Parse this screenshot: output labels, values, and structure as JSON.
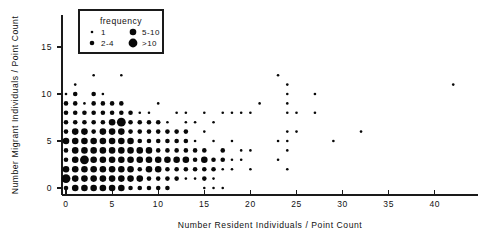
{
  "chart_data": {
    "type": "scatter",
    "title": "",
    "xlabel": "Number Resident Individuals / Point Count",
    "ylabel": "Number Migrant Individuals / Point Count",
    "xlim": [
      -1,
      44
    ],
    "ylim": [
      -1.2,
      17.5
    ],
    "xticks": [
      0,
      5,
      10,
      15,
      20,
      25,
      30,
      35,
      40
    ],
    "yticks": [
      0,
      5,
      10,
      15
    ],
    "xtick_labels": [
      "0",
      "5",
      "10",
      "15",
      "20",
      "25",
      "30",
      "35",
      "40"
    ],
    "ytick_labels": [
      "0",
      "5",
      "10",
      "15"
    ],
    "grid": false,
    "legend_position": "top-left",
    "legend": {
      "title": "frequency",
      "entries": [
        {
          "label": "1",
          "radius": 1.3,
          "bin": [
            1,
            1
          ]
        },
        {
          "label": "2-4",
          "radius": 2.3,
          "bin": [
            2,
            4
          ]
        },
        {
          "label": "5-10",
          "radius": 3.3,
          "bin": [
            5,
            10
          ]
        },
        {
          "label": ">10",
          "radius": 4.4,
          "bin": [
            11,
            999
          ]
        }
      ]
    },
    "encoding": "marker area encodes number of point-count samples at each (x, y) integer coordinate",
    "points": [
      {
        "x": 0,
        "y": 0,
        "f": 3
      },
      {
        "x": 0,
        "y": 1,
        "f": 11
      },
      {
        "x": 0,
        "y": 2,
        "f": 5
      },
      {
        "x": 0,
        "y": 3,
        "f": 3
      },
      {
        "x": 0,
        "y": 4,
        "f": 3
      },
      {
        "x": 0,
        "y": 5,
        "f": 5
      },
      {
        "x": 0,
        "y": 6,
        "f": 2
      },
      {
        "x": 0,
        "y": 7,
        "f": 2
      },
      {
        "x": 0,
        "y": 8,
        "f": 2
      },
      {
        "x": 0,
        "y": 9,
        "f": 2
      },
      {
        "x": 0,
        "y": 10,
        "f": 1
      },
      {
        "x": 1,
        "y": 0,
        "f": 5
      },
      {
        "x": 1,
        "y": 1,
        "f": 8
      },
      {
        "x": 1,
        "y": 2,
        "f": 6
      },
      {
        "x": 1,
        "y": 3,
        "f": 6
      },
      {
        "x": 1,
        "y": 4,
        "f": 7
      },
      {
        "x": 1,
        "y": 5,
        "f": 8
      },
      {
        "x": 1,
        "y": 6,
        "f": 5
      },
      {
        "x": 1,
        "y": 7,
        "f": 3
      },
      {
        "x": 1,
        "y": 8,
        "f": 3
      },
      {
        "x": 1,
        "y": 9,
        "f": 3
      },
      {
        "x": 1,
        "y": 10,
        "f": 3
      },
      {
        "x": 1,
        "y": 11,
        "f": 1
      },
      {
        "x": 2,
        "y": 0,
        "f": 6
      },
      {
        "x": 2,
        "y": 1,
        "f": 7
      },
      {
        "x": 2,
        "y": 2,
        "f": 8
      },
      {
        "x": 2,
        "y": 3,
        "f": 11
      },
      {
        "x": 2,
        "y": 4,
        "f": 9
      },
      {
        "x": 2,
        "y": 5,
        "f": 8
      },
      {
        "x": 2,
        "y": 6,
        "f": 5
      },
      {
        "x": 2,
        "y": 7,
        "f": 3
      },
      {
        "x": 2,
        "y": 8,
        "f": 2
      },
      {
        "x": 2,
        "y": 9,
        "f": 1
      },
      {
        "x": 3,
        "y": 0,
        "f": 8
      },
      {
        "x": 3,
        "y": 1,
        "f": 6
      },
      {
        "x": 3,
        "y": 2,
        "f": 7
      },
      {
        "x": 3,
        "y": 3,
        "f": 9
      },
      {
        "x": 3,
        "y": 4,
        "f": 8
      },
      {
        "x": 3,
        "y": 5,
        "f": 7
      },
      {
        "x": 3,
        "y": 6,
        "f": 4
      },
      {
        "x": 3,
        "y": 7,
        "f": 3
      },
      {
        "x": 3,
        "y": 8,
        "f": 2
      },
      {
        "x": 3,
        "y": 9,
        "f": 2
      },
      {
        "x": 3,
        "y": 10,
        "f": 2
      },
      {
        "x": 3,
        "y": 12,
        "f": 1
      },
      {
        "x": 4,
        "y": 0,
        "f": 6
      },
      {
        "x": 4,
        "y": 1,
        "f": 7
      },
      {
        "x": 4,
        "y": 2,
        "f": 9
      },
      {
        "x": 4,
        "y": 3,
        "f": 8
      },
      {
        "x": 4,
        "y": 4,
        "f": 8
      },
      {
        "x": 4,
        "y": 5,
        "f": 7
      },
      {
        "x": 4,
        "y": 6,
        "f": 5
      },
      {
        "x": 4,
        "y": 7,
        "f": 3
      },
      {
        "x": 4,
        "y": 8,
        "f": 3
      },
      {
        "x": 4,
        "y": 9,
        "f": 2
      },
      {
        "x": 4,
        "y": 10,
        "f": 1
      },
      {
        "x": 5,
        "y": 0,
        "f": 5
      },
      {
        "x": 5,
        "y": 1,
        "f": 7
      },
      {
        "x": 5,
        "y": 2,
        "f": 8
      },
      {
        "x": 5,
        "y": 3,
        "f": 9
      },
      {
        "x": 5,
        "y": 4,
        "f": 7
      },
      {
        "x": 5,
        "y": 5,
        "f": 6
      },
      {
        "x": 5,
        "y": 6,
        "f": 5
      },
      {
        "x": 5,
        "y": 7,
        "f": 5
      },
      {
        "x": 5,
        "y": 8,
        "f": 3
      },
      {
        "x": 5,
        "y": 9,
        "f": 2
      },
      {
        "x": 6,
        "y": 0,
        "f": 5
      },
      {
        "x": 6,
        "y": 1,
        "f": 5
      },
      {
        "x": 6,
        "y": 2,
        "f": 7
      },
      {
        "x": 6,
        "y": 3,
        "f": 8
      },
      {
        "x": 6,
        "y": 4,
        "f": 6
      },
      {
        "x": 6,
        "y": 5,
        "f": 6
      },
      {
        "x": 6,
        "y": 6,
        "f": 5
      },
      {
        "x": 6,
        "y": 7,
        "f": 11
      },
      {
        "x": 6,
        "y": 8,
        "f": 2
      },
      {
        "x": 6,
        "y": 9,
        "f": 2
      },
      {
        "x": 6,
        "y": 12,
        "f": 1
      },
      {
        "x": 7,
        "y": 0,
        "f": 4
      },
      {
        "x": 7,
        "y": 1,
        "f": 5
      },
      {
        "x": 7,
        "y": 2,
        "f": 5
      },
      {
        "x": 7,
        "y": 3,
        "f": 6
      },
      {
        "x": 7,
        "y": 4,
        "f": 6
      },
      {
        "x": 7,
        "y": 5,
        "f": 5
      },
      {
        "x": 7,
        "y": 6,
        "f": 3
      },
      {
        "x": 7,
        "y": 7,
        "f": 2
      },
      {
        "x": 7,
        "y": 8,
        "f": 2
      },
      {
        "x": 8,
        "y": 0,
        "f": 3
      },
      {
        "x": 8,
        "y": 1,
        "f": 5
      },
      {
        "x": 8,
        "y": 2,
        "f": 4
      },
      {
        "x": 8,
        "y": 3,
        "f": 5
      },
      {
        "x": 8,
        "y": 4,
        "f": 6
      },
      {
        "x": 8,
        "y": 5,
        "f": 4
      },
      {
        "x": 8,
        "y": 6,
        "f": 3
      },
      {
        "x": 8,
        "y": 7,
        "f": 2
      },
      {
        "x": 8,
        "y": 8,
        "f": 1
      },
      {
        "x": 9,
        "y": 0,
        "f": 2
      },
      {
        "x": 9,
        "y": 1,
        "f": 3
      },
      {
        "x": 9,
        "y": 2,
        "f": 5
      },
      {
        "x": 9,
        "y": 3,
        "f": 5
      },
      {
        "x": 9,
        "y": 4,
        "f": 5
      },
      {
        "x": 9,
        "y": 5,
        "f": 3
      },
      {
        "x": 9,
        "y": 6,
        "f": 2
      },
      {
        "x": 9,
        "y": 7,
        "f": 2
      },
      {
        "x": 9,
        "y": 8,
        "f": 1
      },
      {
        "x": 10,
        "y": 0,
        "f": 2
      },
      {
        "x": 10,
        "y": 1,
        "f": 3
      },
      {
        "x": 10,
        "y": 2,
        "f": 5
      },
      {
        "x": 10,
        "y": 3,
        "f": 5
      },
      {
        "x": 10,
        "y": 4,
        "f": 4
      },
      {
        "x": 10,
        "y": 5,
        "f": 3
      },
      {
        "x": 10,
        "y": 6,
        "f": 3
      },
      {
        "x": 10,
        "y": 7,
        "f": 2
      },
      {
        "x": 10,
        "y": 9,
        "f": 1
      },
      {
        "x": 11,
        "y": 0,
        "f": 2
      },
      {
        "x": 11,
        "y": 1,
        "f": 2
      },
      {
        "x": 11,
        "y": 2,
        "f": 3
      },
      {
        "x": 11,
        "y": 3,
        "f": 5
      },
      {
        "x": 11,
        "y": 4,
        "f": 3
      },
      {
        "x": 11,
        "y": 5,
        "f": 3
      },
      {
        "x": 11,
        "y": 6,
        "f": 2
      },
      {
        "x": 11,
        "y": 7,
        "f": 1
      },
      {
        "x": 12,
        "y": 1,
        "f": 2
      },
      {
        "x": 12,
        "y": 2,
        "f": 3
      },
      {
        "x": 12,
        "y": 3,
        "f": 5
      },
      {
        "x": 12,
        "y": 4,
        "f": 3
      },
      {
        "x": 12,
        "y": 5,
        "f": 2
      },
      {
        "x": 12,
        "y": 6,
        "f": 2
      },
      {
        "x": 12,
        "y": 8,
        "f": 1
      },
      {
        "x": 13,
        "y": 1,
        "f": 1
      },
      {
        "x": 13,
        "y": 2,
        "f": 3
      },
      {
        "x": 13,
        "y": 3,
        "f": 5
      },
      {
        "x": 13,
        "y": 4,
        "f": 3
      },
      {
        "x": 13,
        "y": 5,
        "f": 2
      },
      {
        "x": 13,
        "y": 6,
        "f": 2
      },
      {
        "x": 13,
        "y": 7,
        "f": 1
      },
      {
        "x": 13,
        "y": 8,
        "f": 1
      },
      {
        "x": 14,
        "y": 1,
        "f": 1
      },
      {
        "x": 14,
        "y": 2,
        "f": 2
      },
      {
        "x": 14,
        "y": 3,
        "f": 3
      },
      {
        "x": 14,
        "y": 4,
        "f": 2
      },
      {
        "x": 14,
        "y": 5,
        "f": 1
      },
      {
        "x": 14,
        "y": 7,
        "f": 1
      },
      {
        "x": 15,
        "y": 0,
        "f": 1
      },
      {
        "x": 15,
        "y": 1,
        "f": 2
      },
      {
        "x": 15,
        "y": 2,
        "f": 2
      },
      {
        "x": 15,
        "y": 3,
        "f": 5
      },
      {
        "x": 15,
        "y": 4,
        "f": 2
      },
      {
        "x": 15,
        "y": 6,
        "f": 1
      },
      {
        "x": 15,
        "y": 8,
        "f": 1
      },
      {
        "x": 16,
        "y": 0,
        "f": 1
      },
      {
        "x": 16,
        "y": 1,
        "f": 1
      },
      {
        "x": 16,
        "y": 2,
        "f": 2
      },
      {
        "x": 16,
        "y": 3,
        "f": 2
      },
      {
        "x": 16,
        "y": 5,
        "f": 1
      },
      {
        "x": 16,
        "y": 7,
        "f": 1
      },
      {
        "x": 17,
        "y": 0,
        "f": 1
      },
      {
        "x": 17,
        "y": 2,
        "f": 1
      },
      {
        "x": 17,
        "y": 3,
        "f": 2
      },
      {
        "x": 17,
        "y": 4,
        "f": 2
      },
      {
        "x": 17,
        "y": 8,
        "f": 1
      },
      {
        "x": 18,
        "y": 2,
        "f": 1
      },
      {
        "x": 18,
        "y": 3,
        "f": 1
      },
      {
        "x": 18,
        "y": 5,
        "f": 1
      },
      {
        "x": 18,
        "y": 8,
        "f": 1
      },
      {
        "x": 19,
        "y": 3,
        "f": 1
      },
      {
        "x": 19,
        "y": 4,
        "f": 1
      },
      {
        "x": 19,
        "y": 8,
        "f": 1
      },
      {
        "x": 20,
        "y": 2,
        "f": 1
      },
      {
        "x": 20,
        "y": 4,
        "f": 1
      },
      {
        "x": 20,
        "y": 8,
        "f": 1
      },
      {
        "x": 21,
        "y": 9,
        "f": 1
      },
      {
        "x": 23,
        "y": 3,
        "f": 1
      },
      {
        "x": 23,
        "y": 5,
        "f": 1
      },
      {
        "x": 23,
        "y": 12,
        "f": 1
      },
      {
        "x": 24,
        "y": 2,
        "f": 1
      },
      {
        "x": 24,
        "y": 4,
        "f": 1
      },
      {
        "x": 24,
        "y": 5,
        "f": 1
      },
      {
        "x": 24,
        "y": 6,
        "f": 1
      },
      {
        "x": 24,
        "y": 8,
        "f": 1
      },
      {
        "x": 24,
        "y": 9,
        "f": 1
      },
      {
        "x": 24,
        "y": 10,
        "f": 1
      },
      {
        "x": 24,
        "y": 11,
        "f": 1
      },
      {
        "x": 25,
        "y": 6,
        "f": 1
      },
      {
        "x": 25,
        "y": 8,
        "f": 1
      },
      {
        "x": 27,
        "y": 8,
        "f": 1
      },
      {
        "x": 27,
        "y": 10,
        "f": 1
      },
      {
        "x": 29,
        "y": 5,
        "f": 1
      },
      {
        "x": 32,
        "y": 6,
        "f": 1
      },
      {
        "x": 42,
        "y": 11,
        "f": 1
      }
    ]
  }
}
